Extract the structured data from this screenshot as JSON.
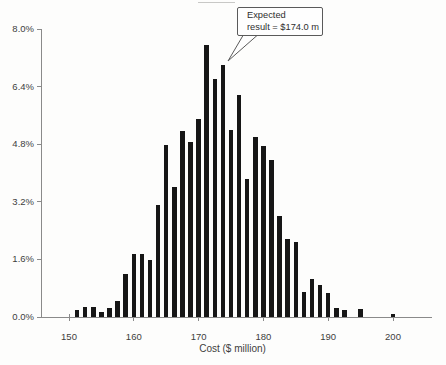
{
  "figure": {
    "background": "#fdfdfc",
    "bar_color": "#161616",
    "axis_color": "#8a8a8a",
    "label_color": "#3d3d3d"
  },
  "callout": {
    "line1": "Expected",
    "line2": "result = $174.0 m"
  },
  "chart_data": {
    "type": "bar",
    "title": "",
    "xlabel": "Cost ($ million)",
    "ylabel": "",
    "grid": false,
    "xlim": [
      145,
      206
    ],
    "ylim": [
      0,
      8.0
    ],
    "bin_width": 1.25,
    "y_ticks": [
      {
        "value": 0.0,
        "label": "0.0%"
      },
      {
        "value": 1.6,
        "label": "1.6%"
      },
      {
        "value": 3.2,
        "label": "3.2%"
      },
      {
        "value": 4.8,
        "label": "4.8%"
      },
      {
        "value": 6.4,
        "label": "6.4%"
      },
      {
        "value": 8.0,
        "label": "8.0%"
      }
    ],
    "x_ticks": [
      {
        "value": 150,
        "label": "150"
      },
      {
        "value": 160,
        "label": "160"
      },
      {
        "value": 170,
        "label": "170"
      },
      {
        "value": 180,
        "label": "180"
      },
      {
        "value": 190,
        "label": "190"
      },
      {
        "value": 200,
        "label": "200"
      }
    ],
    "x": [
      151.25,
      152.5,
      153.75,
      155,
      156.25,
      157.5,
      158.75,
      160,
      161.25,
      162.5,
      163.75,
      165,
      166.25,
      167.5,
      168.75,
      170,
      171.25,
      172.5,
      173.75,
      175,
      176.25,
      177.5,
      178.75,
      180,
      181.25,
      182.5,
      183.75,
      185,
      186.25,
      187.5,
      188.75,
      190,
      191.25,
      192.5,
      193.75,
      195,
      196.25,
      197.5,
      198.75,
      200
    ],
    "values": [
      0.2,
      0.27,
      0.28,
      0.15,
      0.24,
      0.45,
      1.2,
      1.76,
      1.74,
      1.58,
      3.1,
      4.77,
      3.6,
      5.16,
      4.86,
      5.5,
      7.55,
      6.6,
      7.0,
      5.2,
      6.17,
      3.83,
      5.0,
      4.75,
      4.35,
      2.82,
      2.17,
      2.09,
      0.7,
      1.05,
      0.88,
      0.68,
      0.26,
      0.19,
      0.0,
      0.21,
      0.0,
      0.0,
      0.0,
      0.08
    ],
    "annotation": {
      "text": "Expected result = $174.0 m",
      "target_x": 173.75,
      "target_y": 7.0
    }
  }
}
